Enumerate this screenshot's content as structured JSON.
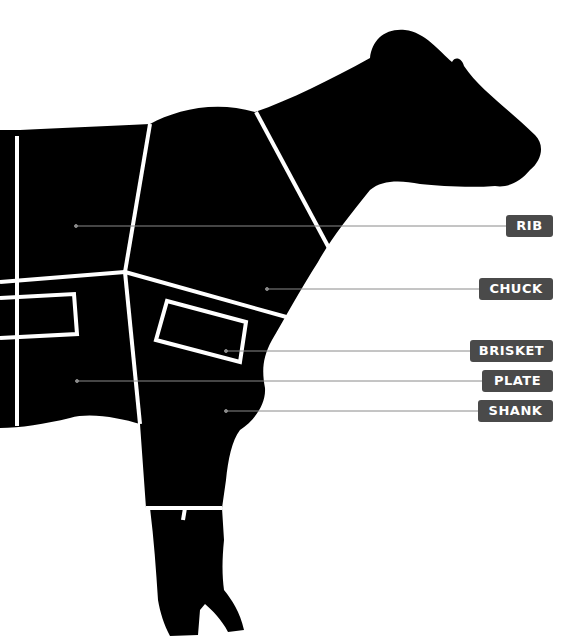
{
  "diagram": {
    "colors": {
      "silhouette": "#000000",
      "divider": "#ffffff",
      "label_bg": "#4a4a4a",
      "label_text": "#ffffff",
      "leader_line": "#8a8a8a"
    },
    "labels": [
      {
        "id": "rib",
        "text": "RIB",
        "dot": [
          76,
          227
        ],
        "box_x": 506,
        "box_y": 215,
        "box_w": 47
      },
      {
        "id": "chuck",
        "text": "CHUCK",
        "dot": [
          267,
          289
        ],
        "box_x": 479,
        "box_y": 278,
        "box_w": 74
      },
      {
        "id": "brisket",
        "text": "BRISKET",
        "dot": [
          226,
          350
        ],
        "box_x": 470,
        "box_y": 340,
        "box_w": 83
      },
      {
        "id": "plate",
        "text": "PLATE",
        "dot": [
          77,
          381
        ],
        "box_x": 482,
        "box_y": 370,
        "box_w": 71
      },
      {
        "id": "shank",
        "text": "SHANK",
        "dot": [
          226,
          411
        ],
        "box_x": 478,
        "box_y": 400,
        "box_w": 75
      }
    ]
  }
}
